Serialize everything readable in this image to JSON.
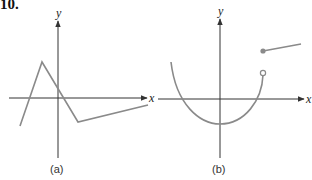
{
  "problem_number": "10.",
  "colors": {
    "axis": "#333333",
    "curve": "#8a8a8a",
    "background": "#ffffff"
  },
  "panels": [
    {
      "label": "(a)",
      "x_axis_label": "x",
      "y_axis_label": "y",
      "description": "Piecewise linear graph: rises steeply to a peak left of the y-axis, falls steeply crossing the x-axis just right of origin to a minimum below the x-axis, then rises gently to the right.",
      "points": [
        [
          20,
          126
        ],
        [
          42,
          62
        ],
        [
          78,
          122
        ],
        [
          148,
          105
        ]
      ]
    },
    {
      "label": "(b)",
      "x_axis_label": "x",
      "y_axis_label": "y",
      "description": "U-shaped curve with minimum below the origin, ending at an open circle above the x-axis; a separate line segment begins at a filled dot above that open circle and rises slightly to the right (jump discontinuity).",
      "open_circle": [
        263,
        73
      ],
      "filled_dot": [
        263,
        51
      ],
      "segment_end": [
        301,
        45
      ]
    }
  ]
}
